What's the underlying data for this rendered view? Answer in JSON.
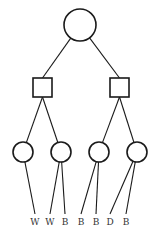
{
  "diagram": {
    "type": "game-tree",
    "colors": {
      "stroke": "#1a1a1a",
      "label": "#333333",
      "background": "#ffffff"
    },
    "root": {
      "shape": "circle",
      "cx": 80,
      "cy": 25,
      "r": 16
    },
    "level1": [
      {
        "shape": "square",
        "x": 33,
        "y": 78,
        "size": 19
      },
      {
        "shape": "square",
        "x": 110,
        "y": 78,
        "size": 19
      }
    ],
    "level2": [
      {
        "shape": "circle",
        "cx": 23,
        "cy": 152,
        "r": 10,
        "parent": 0
      },
      {
        "shape": "circle",
        "cx": 61,
        "cy": 152,
        "r": 10,
        "parent": 0
      },
      {
        "shape": "circle",
        "cx": 99,
        "cy": 152,
        "r": 10,
        "parent": 1
      },
      {
        "shape": "circle",
        "cx": 137,
        "cy": 152,
        "r": 10,
        "parent": 1
      }
    ],
    "leaves": [
      {
        "label": "W",
        "x": 35,
        "parent": 0
      },
      {
        "label": "W",
        "x": 50,
        "parent": 1
      },
      {
        "label": "B",
        "x": 65,
        "parent": 1
      },
      {
        "label": "B",
        "x": 81,
        "parent": 2
      },
      {
        "label": "B",
        "x": 96,
        "parent": 2
      },
      {
        "label": "D",
        "x": 110,
        "parent": 3
      },
      {
        "label": "B",
        "x": 126,
        "parent": 3
      }
    ],
    "leaf_label_y": 225,
    "leaf_line_end_y": 214
  }
}
